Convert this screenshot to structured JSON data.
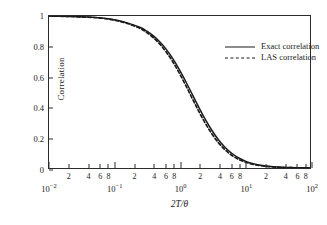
{
  "chart_data": {
    "type": "line",
    "title": "",
    "xlabel": "2T/θ",
    "ylabel": "Correlation",
    "xscale": "log",
    "xlim": [
      0.01,
      100
    ],
    "ylim": [
      0,
      1
    ],
    "grid": false,
    "legend_position": "upper-right",
    "x_major_ticks": [
      {
        "value": 0.01,
        "mantissa": "10",
        "exponent": "−2"
      },
      {
        "value": 0.1,
        "mantissa": "10",
        "exponent": "−1"
      },
      {
        "value": 1,
        "mantissa": "10",
        "exponent": "0"
      },
      {
        "value": 10,
        "mantissa": "10",
        "exponent": "1"
      },
      {
        "value": 100,
        "mantissa": "10",
        "exponent": "2"
      }
    ],
    "x_minor_ticks": [
      2,
      4,
      6,
      8
    ],
    "x_minor_tick_labels": [
      "2",
      "4",
      "6",
      "8"
    ],
    "y_ticks": [
      0,
      0.2,
      0.4,
      0.6,
      0.8,
      1
    ],
    "y_tick_labels": [
      "0",
      "0.2",
      "0.4",
      "0.6",
      "0.8",
      "1"
    ],
    "series": [
      {
        "name": "Exact correlation",
        "style": "solid",
        "color": "#1a1a1a",
        "x": [
          0.01,
          0.0158,
          0.0251,
          0.0398,
          0.0631,
          0.1,
          0.1585,
          0.2512,
          0.3162,
          0.3981,
          0.5012,
          0.631,
          0.7943,
          1.0,
          1.2589,
          1.5849,
          1.9953,
          2.5119,
          3.1623,
          3.9811,
          5.0119,
          6.3096,
          7.9433,
          10.0,
          12.589,
          15.849,
          19.953,
          25.119,
          31.623,
          39.811,
          50.119,
          63.096,
          79.433,
          100.0
        ],
        "y": [
          0.999,
          0.998,
          0.996,
          0.993,
          0.987,
          0.975,
          0.955,
          0.924,
          0.9,
          0.869,
          0.829,
          0.779,
          0.718,
          0.646,
          0.566,
          0.481,
          0.396,
          0.316,
          0.245,
          0.184,
          0.135,
          0.097,
          0.068,
          0.047,
          0.032,
          0.022,
          0.015,
          0.01,
          0.0065,
          0.0043,
          0.0028,
          0.0018,
          0.0012,
          0.0008
        ]
      },
      {
        "name": "LAS correlation",
        "style": "dashed",
        "color": "#1a1a1a",
        "x": [
          0.01,
          0.0158,
          0.0251,
          0.0398,
          0.0631,
          0.1,
          0.1585,
          0.2512,
          0.3162,
          0.3981,
          0.5012,
          0.631,
          0.7943,
          1.0,
          1.2589,
          1.5849,
          1.9953,
          2.5119,
          3.1623,
          3.9811,
          5.0119,
          6.3096,
          7.9433,
          10.0,
          12.589,
          15.849,
          19.953,
          25.119,
          31.623,
          39.811,
          50.119,
          63.096,
          79.433,
          100.0
        ],
        "y": [
          0.999,
          0.998,
          0.996,
          0.992,
          0.986,
          0.973,
          0.951,
          0.917,
          0.891,
          0.857,
          0.814,
          0.761,
          0.697,
          0.622,
          0.54,
          0.454,
          0.369,
          0.291,
          0.222,
          0.165,
          0.119,
          0.084,
          0.058,
          0.04,
          0.027,
          0.018,
          0.012,
          0.008,
          0.0053,
          0.0035,
          0.0023,
          0.0015,
          0.001,
          0.0007
        ]
      }
    ]
  },
  "axes": {
    "y_title": "Correlation",
    "x_title": "2T/θ"
  },
  "legend": {
    "entries": [
      {
        "label": "Exact correlation",
        "style": "solid"
      },
      {
        "label": "LAS correlation",
        "style": "dashed"
      }
    ]
  }
}
